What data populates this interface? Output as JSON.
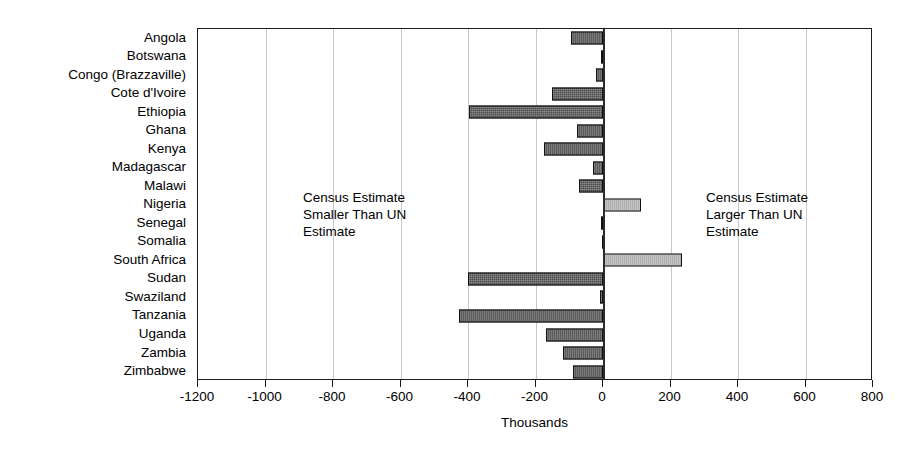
{
  "chart_data": {
    "type": "bar",
    "orientation": "horizontal",
    "title": "",
    "subtitle": "",
    "xlabel": "Thousands",
    "ylabel": "",
    "xlim": [
      -1200,
      800
    ],
    "xticks": [
      -1200,
      -1000,
      -800,
      -600,
      -400,
      -200,
      0,
      200,
      400,
      600,
      800
    ],
    "xtick_labels": [
      "-1200",
      "-1000",
      "-800",
      "-600",
      "-400",
      "-200",
      "0",
      "200",
      "400",
      "600",
      "800"
    ],
    "grid": true,
    "grid_axis": "x",
    "legend": "none",
    "categories": [
      "Angola",
      "Botswana",
      "Congo (Brazzaville)",
      "Cote d'Ivoire",
      "Ethiopia",
      "Ghana",
      "Kenya",
      "Madagascar",
      "Malawi",
      "Nigeria",
      "Senegal",
      "Somalia",
      "South Africa",
      "Sudan",
      "Swaziland",
      "Tanzania",
      "Uganda",
      "Zambia",
      "Zimbabwe"
    ],
    "values": [
      -96,
      -5,
      -22,
      -150,
      -396,
      -78,
      -175,
      -30,
      -70,
      114,
      -6,
      -4,
      235,
      -400,
      -8,
      -428,
      -170,
      -120,
      -90
    ],
    "annotations": [
      {
        "name": "left-annotation",
        "text": "Census Estimate\nSmaller Than UN\nEstimate"
      },
      {
        "name": "right-annotation",
        "text": "Census Estimate\nLarger Than UN\nEstimate"
      }
    ],
    "colors": {
      "negative_bar": "#4a4a4a",
      "positive_bar": "#d2d2d2",
      "bar_border": "#111111",
      "gridline": "#c9c9c9",
      "axis": "#1a1a1a",
      "background": "#ffffff"
    }
  }
}
